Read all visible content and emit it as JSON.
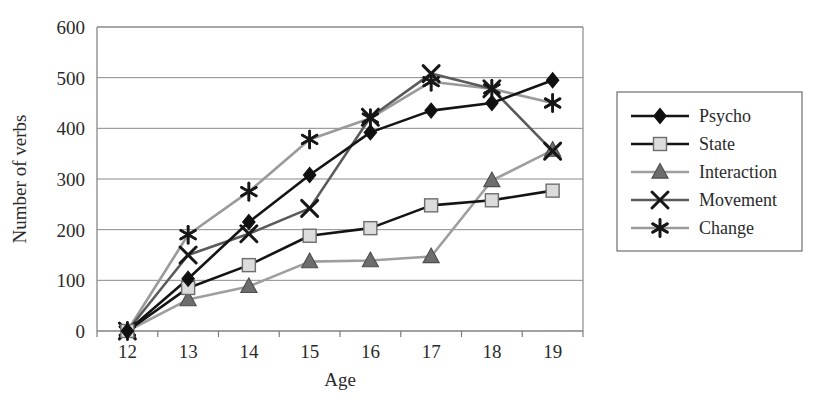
{
  "chart_data": {
    "type": "line",
    "title": "",
    "xlabel": "Age",
    "ylabel": "Number of verbs",
    "x": [
      12,
      13,
      14,
      15,
      16,
      17,
      18,
      19
    ],
    "xtick_labels": [
      "12",
      "13",
      "14",
      "15",
      "16",
      "17",
      "18",
      "19"
    ],
    "ytick_labels": [
      "0",
      "100",
      "200",
      "300",
      "400",
      "500",
      "600"
    ],
    "yticks": [
      0,
      100,
      200,
      300,
      400,
      500,
      600
    ],
    "ylim": [
      0,
      600
    ],
    "grid": "horizontal",
    "legend_position": "right-outside",
    "series": [
      {
        "name": "Psycho",
        "values": [
          0,
          103,
          215,
          308,
          392,
          435,
          450,
          495
        ],
        "color": "#141414",
        "marker": "diamond",
        "marker_fill": "#101010",
        "line_width": 2.6
      },
      {
        "name": "State",
        "values": [
          0,
          85,
          130,
          188,
          203,
          248,
          258,
          277
        ],
        "color": "#141414",
        "marker": "square",
        "marker_fill": "#dcdcdc",
        "line_width": 2.6
      },
      {
        "name": "Interaction",
        "values": [
          0,
          62,
          88,
          137,
          139,
          147,
          297,
          357
        ],
        "color": "#9e9e9e",
        "marker": "triangle",
        "marker_fill": "#6d6d6d",
        "line_width": 2.6
      },
      {
        "name": "Movement",
        "values": [
          0,
          150,
          192,
          242,
          422,
          508,
          478,
          355
        ],
        "color": "#5a5a5a",
        "marker": "cross",
        "marker_fill": "#171717",
        "line_width": 2.6
      },
      {
        "name": "Change",
        "values": [
          0,
          190,
          275,
          378,
          420,
          492,
          478,
          450
        ],
        "color": "#9a9a9a",
        "marker": "asterisk",
        "marker_fill": "#171717",
        "line_width": 2.6
      }
    ]
  },
  "legend": {
    "entries": [
      {
        "label": "Psycho"
      },
      {
        "label": "State"
      },
      {
        "label": "Interaction"
      },
      {
        "label": "Movement"
      },
      {
        "label": "Change"
      }
    ]
  }
}
